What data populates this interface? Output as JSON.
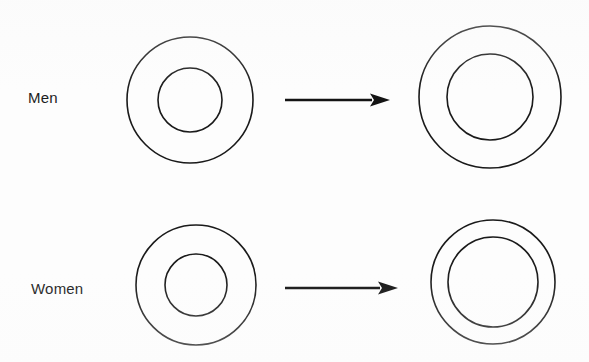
{
  "figure": {
    "type": "diagram",
    "background_color": "#fdfdfd",
    "stroke_color": "#1a1a1a",
    "width": 589,
    "height": 362
  },
  "rows": [
    {
      "id": "men",
      "label": "Men",
      "label_x": 28,
      "label_y": 90,
      "before": {
        "name": "men-before-rings",
        "cx": 190,
        "cy": 100,
        "outer_r": 63,
        "inner_r": 32,
        "stroke_width": 1.6
      },
      "arrow": {
        "name": "men-arrow",
        "x1": 285,
        "x2": 390,
        "y": 100,
        "shaft_width": 2.6,
        "head_length": 20,
        "head_width": 13
      },
      "after": {
        "name": "men-after-rings",
        "cx": 490,
        "cy": 97,
        "outer_r": 71,
        "inner_r": 43,
        "stroke_width": 1.6
      }
    },
    {
      "id": "women",
      "label": "Women",
      "label_x": 31,
      "label_y": 281,
      "before": {
        "name": "women-before-rings",
        "cx": 196,
        "cy": 285,
        "outer_r": 60,
        "inner_r": 31,
        "stroke_width": 1.6
      },
      "arrow": {
        "name": "women-arrow",
        "x1": 285,
        "x2": 398,
        "y": 288,
        "shaft_width": 2.6,
        "head_length": 20,
        "head_width": 13
      },
      "after": {
        "name": "women-after-rings",
        "cx": 493,
        "cy": 282,
        "outer_r": 62,
        "inner_r": 45,
        "stroke_width": 1.6
      }
    }
  ]
}
